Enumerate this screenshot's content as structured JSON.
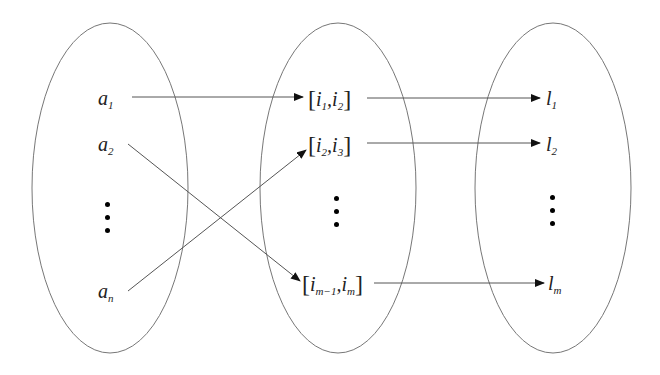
{
  "diagram": {
    "type": "mapping-diagram",
    "sets": [
      {
        "id": "left",
        "name": "a-set",
        "cx": 110,
        "cy": 188,
        "rx": 78,
        "ry": 165
      },
      {
        "id": "middle",
        "name": "interval-set",
        "cx": 338,
        "cy": 188,
        "rx": 78,
        "ry": 165
      },
      {
        "id": "right",
        "name": "l-set",
        "cx": 553,
        "cy": 188,
        "rx": 78,
        "ry": 165
      }
    ],
    "left_items": [
      {
        "base": "a",
        "sub": "1"
      },
      {
        "base": "a",
        "sub": "2"
      },
      {
        "base": "a",
        "sub": "n"
      }
    ],
    "middle_items": [
      {
        "open": "[",
        "a": "i",
        "a_sub": "1",
        "sep": ",",
        "b": "i",
        "b_sub": "2",
        "close": "]"
      },
      {
        "open": "[",
        "a": "i",
        "a_sub": "2",
        "sep": ",",
        "b": "i",
        "b_sub": "3",
        "close": "]"
      },
      {
        "open": "[",
        "a": "i",
        "a_sub": "m−1",
        "sep": ",",
        "b": "i",
        "b_sub": "m",
        "close": "]"
      }
    ],
    "right_items": [
      {
        "base": "l",
        "sub": "1"
      },
      {
        "base": "l",
        "sub": "2"
      },
      {
        "base": "l",
        "sub": "m"
      }
    ],
    "edges": [
      {
        "from": "a_1",
        "to": "[i_1,i_2]"
      },
      {
        "from": "a_2",
        "to": "[i_m-1,i_m]"
      },
      {
        "from": "a_n",
        "to": "[i_2,i_3]"
      },
      {
        "from": "[i_1,i_2]",
        "to": "l_1"
      },
      {
        "from": "[i_2,i_3]",
        "to": "l_2"
      },
      {
        "from": "[i_m-1,i_m]",
        "to": "l_m"
      }
    ],
    "colors": {
      "stroke": "#555555",
      "ellipse": "#777777",
      "text": "#222222"
    }
  }
}
